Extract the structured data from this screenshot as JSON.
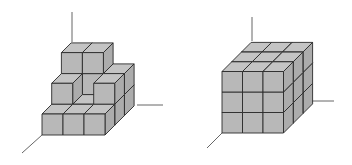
{
  "figures": [
    {
      "id": "stepped-stack",
      "description": "Stepped arrangement of unit cubes on 3D axes",
      "origin": [
        42,
        135
      ],
      "cube_size": 21,
      "depth_offset": [
        9.7,
        -9.7
      ],
      "axes": {
        "vertical": [
          [
            72,
            12
          ],
          [
            72,
            42
          ]
        ],
        "horizontal": [
          [
            137,
            105
          ],
          [
            163,
            105
          ]
        ],
        "diagonal": [
          [
            42,
            135
          ],
          [
            22,
            153
          ]
        ]
      },
      "heights_by_depth": [
        [
          1,
          1,
          1
        ],
        [
          2,
          1,
          2
        ],
        [
          3,
          3,
          2
        ]
      ]
    },
    {
      "id": "full-cube",
      "description": "3x3x3 cube made of unit cubes on 3D axes",
      "origin": [
        222,
        133
      ],
      "cube_size": 20.5,
      "depth_offset": [
        9.7,
        -9.7
      ],
      "axes": {
        "vertical": [
          [
            252,
            17
          ],
          [
            252,
            41
          ]
        ],
        "horizontal": [
          [
            312,
            101
          ],
          [
            334,
            101
          ]
        ],
        "diagonal": [
          [
            222,
            133
          ],
          [
            207,
            148
          ]
        ]
      },
      "heights_by_depth": [
        [
          3,
          3,
          3
        ],
        [
          3,
          3,
          3
        ],
        [
          3,
          3,
          3
        ]
      ]
    }
  ],
  "colors": {
    "face": "#b8b8b8",
    "top": "#c4c4c4",
    "side": "#acacac",
    "edge": "#2a2a2a",
    "axis": "#666666",
    "background": "#ffffff"
  }
}
